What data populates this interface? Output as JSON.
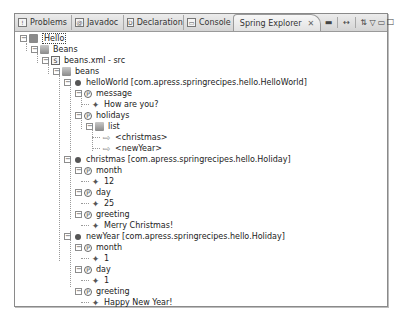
{
  "tabs": [
    {
      "label": "Problems",
      "icon": "problems-icon"
    },
    {
      "label": "Javadoc",
      "icon": "javadoc-icon"
    },
    {
      "label": "Declaration",
      "icon": "declaration-icon"
    },
    {
      "label": "Console",
      "icon": "console-icon"
    },
    {
      "label": "Spring Explorer",
      "icon": "spring-icon",
      "active": true,
      "close": "✕"
    }
  ],
  "toolbar": {
    "collapse": "▬",
    "link": "↔",
    "filter": "⇅",
    "view_menu": "▽",
    "minimize": "▭",
    "maximize": "□"
  },
  "tree": {
    "project": "Hello",
    "beans_node": "Beans",
    "config_file": "beans.xml - src",
    "beans_folder": "beans",
    "bean1": {
      "label": "helloWorld [com.apress.springrecipes.hello.HelloWorld]",
      "props": [
        {
          "name": "message",
          "values": [
            "How are you?"
          ]
        },
        {
          "name": "holidays",
          "list_label": "list",
          "refs": [
            "<christmas>",
            "<newYear>"
          ]
        }
      ]
    },
    "bean2": {
      "label": "christmas [com.apress.springrecipes.hello.Holiday]",
      "props": [
        {
          "name": "month",
          "value": "12"
        },
        {
          "name": "day",
          "value": "25"
        },
        {
          "name": "greeting",
          "value": "Merry Christmas!"
        }
      ]
    },
    "bean3": {
      "label": "newYear [com.apress.springrecipes.hello.Holiday]",
      "props": [
        {
          "name": "month",
          "value": "1"
        },
        {
          "name": "day",
          "value": "1"
        },
        {
          "name": "greeting",
          "value": "Happy New Year!"
        }
      ]
    }
  }
}
